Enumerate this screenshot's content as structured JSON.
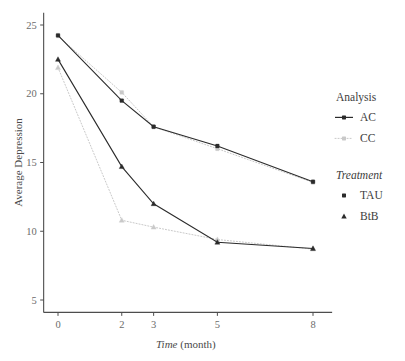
{
  "chart_data": {
    "type": "line",
    "title": "",
    "subtitle": "",
    "xlabel": "Time (month)",
    "xlabel_italic_part": "Time",
    "xlabel_plain_part": " (month)",
    "ylabel": "Average Depression",
    "x": [
      0,
      2,
      3,
      5,
      8
    ],
    "xticklabels": [
      "0",
      "2",
      "3",
      "5",
      "8"
    ],
    "yticks": [
      5,
      10,
      15,
      20,
      25
    ],
    "yticklabels": [
      "5",
      "10",
      "15",
      "20",
      "25"
    ],
    "xlim": [
      -0.45,
      8.6
    ],
    "ylim": [
      4.1,
      25.9
    ],
    "grid": false,
    "legend_position": "right",
    "series": [
      {
        "name": "TAU (AC)",
        "analysis": "AC",
        "treatment": "TAU",
        "marker": "circle",
        "linestyle": "solid",
        "color": "#2b2b2b",
        "x": [
          0,
          2,
          3,
          5,
          8
        ],
        "values": [
          24.25,
          19.5,
          17.6,
          16.2,
          13.6
        ]
      },
      {
        "name": "BtB (AC)",
        "analysis": "AC",
        "treatment": "BtB",
        "marker": "triangle",
        "linestyle": "solid",
        "color": "#2b2b2b",
        "x": [
          0,
          2,
          3,
          5,
          8
        ],
        "values": [
          22.5,
          14.7,
          12.0,
          9.2,
          8.75
        ]
      },
      {
        "name": "TAU (CC)",
        "analysis": "CC",
        "treatment": "TAU",
        "marker": "circle",
        "linestyle": "dotted",
        "color": "#c9c9c9",
        "x": [
          0,
          2,
          3,
          5,
          8
        ],
        "values": [
          24.2,
          20.1,
          17.6,
          16.0,
          13.55
        ]
      },
      {
        "name": "BtB (CC)",
        "analysis": "CC",
        "treatment": "BtB",
        "marker": "triangle",
        "linestyle": "dotted",
        "color": "#c9c9c9",
        "x": [
          0,
          2,
          3,
          5,
          8
        ],
        "values": [
          21.9,
          10.8,
          10.3,
          9.4,
          8.7
        ]
      }
    ],
    "legends": [
      {
        "title": "Analysis",
        "title_italic": false,
        "entries": [
          {
            "label": "AC",
            "color": "#2b2b2b",
            "glyph": "line-point",
            "linestyle": "solid"
          },
          {
            "label": "CC",
            "color": "#c9c9c9",
            "glyph": "line-point",
            "linestyle": "dotted"
          }
        ]
      },
      {
        "title": "Treatment",
        "title_italic": true,
        "entries": [
          {
            "label": "TAU",
            "color": "#2b2b2b",
            "glyph": "circle"
          },
          {
            "label": "BtB",
            "color": "#2b2b2b",
            "glyph": "triangle"
          }
        ]
      }
    ],
    "colors": {
      "ac": "#2b2b2b",
      "cc": "#c9c9c9",
      "axis": "#4d4d4d",
      "tick_text": "#6b6b6b",
      "background": "#ffffff"
    }
  }
}
